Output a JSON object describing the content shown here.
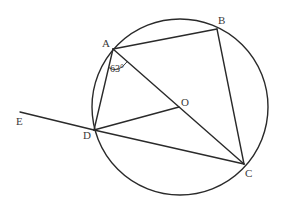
{
  "diagram": {
    "type": "circle-geometry",
    "circle": {
      "center": "O",
      "cx": 180,
      "cy": 107,
      "r": 88
    },
    "points": {
      "A": {
        "x": 113,
        "y": 49,
        "label": "A",
        "lx": 102,
        "ly": 47
      },
      "B": {
        "x": 217,
        "y": 29,
        "label": "B",
        "lx": 218,
        "ly": 24
      },
      "C": {
        "x": 244,
        "y": 164,
        "label": "C",
        "lx": 245,
        "ly": 177
      },
      "D": {
        "x": 94,
        "y": 130,
        "label": "D",
        "lx": 82,
        "ly": 139
      },
      "O": {
        "x": 179,
        "y": 107,
        "label": "O",
        "lx": 181,
        "ly": 106
      },
      "E": {
        "x": 20,
        "y": 112,
        "label": "E",
        "lx": 16,
        "ly": 124
      }
    },
    "segments": [
      {
        "from": "A",
        "to": "B"
      },
      {
        "from": "B",
        "to": "C"
      },
      {
        "from": "A",
        "to": "D"
      },
      {
        "from": "A",
        "to": "C"
      },
      {
        "from": "D",
        "to": "O"
      },
      {
        "from": "D",
        "to": "C"
      },
      {
        "from": "E",
        "to": "D"
      }
    ],
    "angle_marks": [
      {
        "vertex": "A",
        "between": [
          "D",
          "C"
        ],
        "value": "63°"
      }
    ]
  },
  "labels": {
    "A": "A",
    "B": "B",
    "C": "C",
    "D": "D",
    "O": "O",
    "E": "E",
    "angle_DAC": "63°"
  }
}
